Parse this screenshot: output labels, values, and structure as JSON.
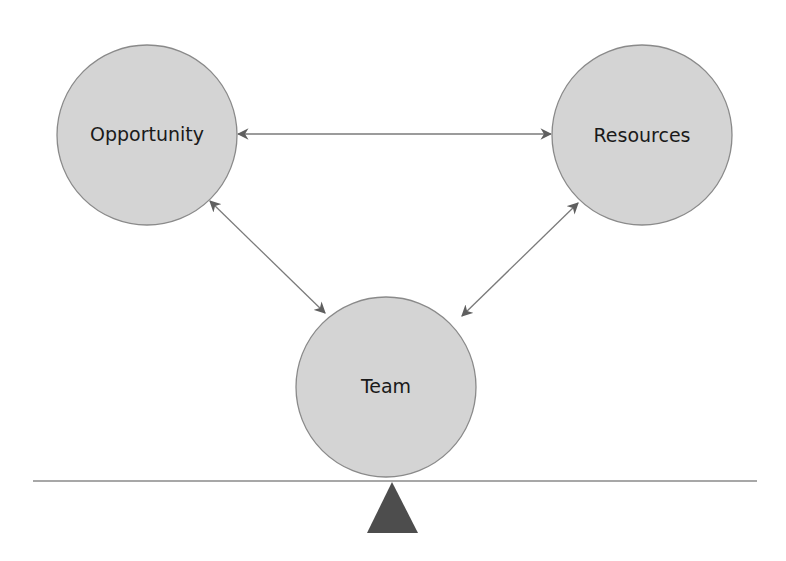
{
  "diagram": {
    "nodes": [
      {
        "id": "opportunity",
        "label": "Opportunity",
        "cx": 147,
        "cy": 135,
        "r": 90
      },
      {
        "id": "resources",
        "label": "Resources",
        "cx": 642,
        "cy": 135,
        "r": 90
      },
      {
        "id": "team",
        "label": "Team",
        "cx": 386,
        "cy": 385,
        "r": 90
      }
    ],
    "edges": [
      {
        "from": "opportunity",
        "to": "resources",
        "bidirectional": true
      },
      {
        "from": "opportunity",
        "to": "team",
        "bidirectional": true
      },
      {
        "from": "resources",
        "to": "team",
        "bidirectional": true
      }
    ],
    "baseline": {
      "y": 481,
      "x1": 33,
      "x2": 757
    },
    "fulcrum": {
      "shape": "triangle"
    },
    "colors": {
      "node_fill": "#d4d4d4",
      "node_stroke": "#8a8a8a",
      "arrow": "#6e6e6e",
      "line": "#8a8a8a",
      "fulcrum": "#4d4d4d"
    }
  }
}
